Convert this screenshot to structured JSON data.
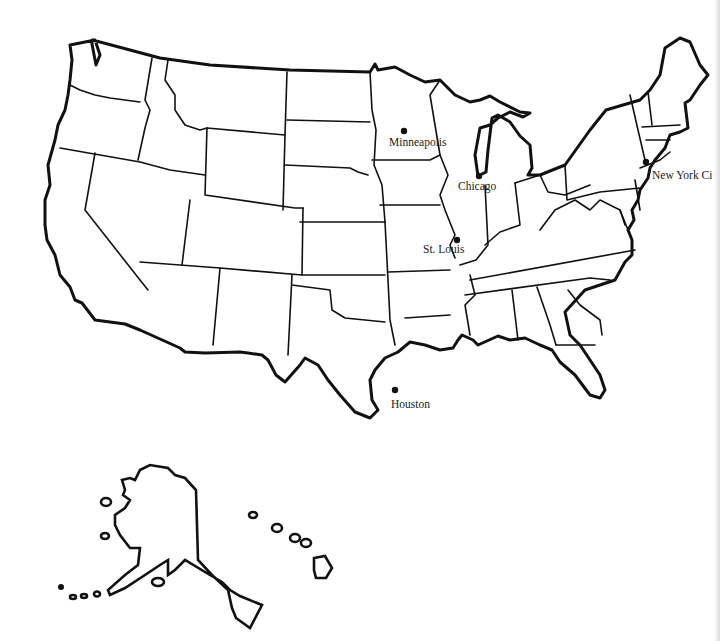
{
  "map": {
    "title": "United States outline map",
    "region": "United States",
    "colors": {
      "background": "#ffffff",
      "lines": "#111111",
      "labels": "#222222"
    },
    "cities": [
      {
        "name": "Minneapolis",
        "dot": [
          404,
          131
        ],
        "label": [
          389,
          137
        ]
      },
      {
        "name": "Chicago",
        "dot": [
          479,
          176
        ],
        "label": [
          458,
          181
        ]
      },
      {
        "name": "New York City",
        "display": "New York Ci",
        "dot": [
          646,
          162
        ],
        "label": [
          652,
          170
        ]
      },
      {
        "name": "St. Louis",
        "dot": [
          457,
          240
        ],
        "label": [
          423,
          243
        ]
      },
      {
        "name": "Houston",
        "dot": [
          395,
          390
        ],
        "label": [
          391,
          398
        ]
      }
    ],
    "insets": [
      "Alaska",
      "Hawaii"
    ]
  }
}
